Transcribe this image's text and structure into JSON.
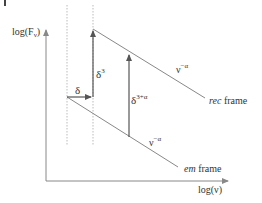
{
  "diagram": {
    "y_axis_label": "log(F",
    "y_axis_label_sub": "ν",
    "y_axis_label_close": ")",
    "x_axis_label": "log(ν)",
    "delta_label": "δ",
    "delta3_label": "δ",
    "delta3_sup": "3",
    "delta3a_label": "δ",
    "delta3a_sup": "3+α",
    "rec_slope_label": "ν",
    "rec_slope_sup": "−α",
    "em_slope_label": "ν",
    "em_slope_sup": "−α",
    "rec_frame_prefix": "rec",
    "rec_frame_suffix": " frame",
    "em_frame_prefix": "em",
    "em_frame_suffix": " frame",
    "colors": {
      "axis": "#888888",
      "line": "#888888",
      "arrow": "#555555",
      "dotted": "#bbbbbb",
      "text": "#333333"
    }
  }
}
